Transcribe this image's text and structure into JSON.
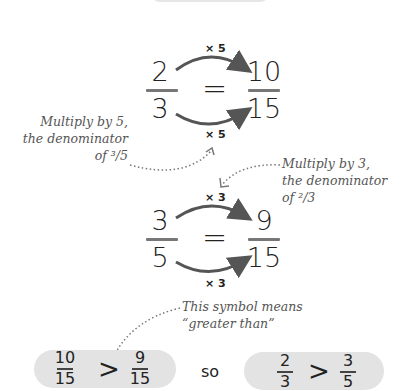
{
  "equation1": {
    "left": {
      "numerator": "2",
      "denominator": "3"
    },
    "equals": "=",
    "right": {
      "numerator": "10",
      "denominator": "15"
    },
    "top_multiplier": "× 5",
    "bottom_multiplier": "× 5"
  },
  "note1": {
    "lines": [
      "Multiply by 5,",
      "the denominator",
      "of ³/5"
    ]
  },
  "note2": {
    "lines": [
      "Multiply by 3,",
      "the denominator",
      "of ²/3"
    ]
  },
  "equation2": {
    "left": {
      "numerator": "3",
      "denominator": "5"
    },
    "equals": "=",
    "right": {
      "numerator": "9",
      "denominator": "15"
    },
    "top_multiplier": "× 3",
    "bottom_multiplier": "× 3"
  },
  "note3": {
    "lines": [
      "This symbol means",
      "“greater than”"
    ]
  },
  "comparison1": {
    "left": {
      "numerator": "10",
      "denominator": "15"
    },
    "symbol": ">",
    "right": {
      "numerator": "9",
      "denominator": "15"
    }
  },
  "connector": "so",
  "comparison2": {
    "left": {
      "numerator": "2",
      "denominator": "3"
    },
    "symbol": ">",
    "right": {
      "numerator": "3",
      "denominator": "5"
    }
  },
  "colors": {
    "pill_background": "#e3e3e3",
    "arrow": "#555555",
    "note_text": "#555555"
  }
}
